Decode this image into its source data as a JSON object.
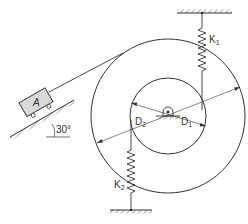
{
  "diagram": {
    "type": "mechanical-vibration-system",
    "labels": {
      "block": "A",
      "angle": "30°",
      "spring_top": "K",
      "spring_top_sub": "1",
      "spring_bottom": "K",
      "spring_bottom_sub": "2",
      "inner_diameter": "D",
      "inner_diameter_sub": "1",
      "outer_diameter": "D",
      "outer_diameter_sub": "2"
    },
    "colors": {
      "line": "#333333",
      "block_fill": "#d9d9d9",
      "background": "#ffffff"
    }
  }
}
